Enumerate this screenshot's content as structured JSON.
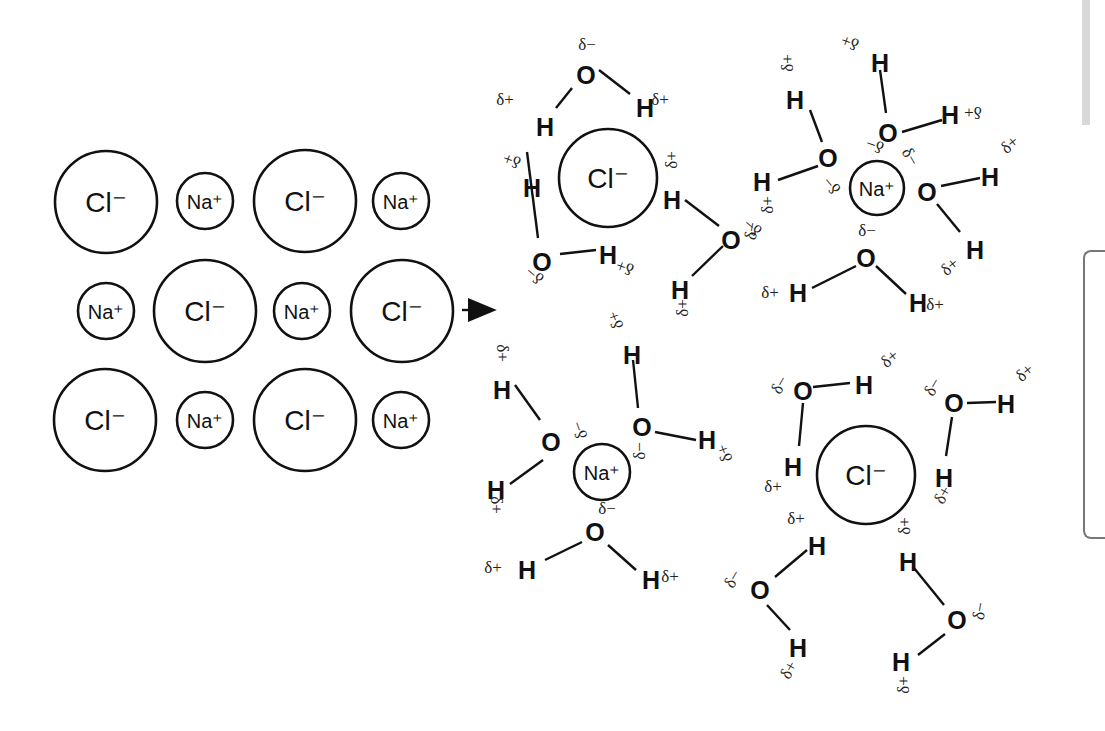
{
  "diagram": {
    "arrow": {
      "x1": 462,
      "y1": 310,
      "x2": 500,
      "y2": 310
    },
    "crystal": {
      "ions": [
        {
          "label": "Cl⁻",
          "x": 106,
          "y": 202,
          "r": 51,
          "type": "Cl"
        },
        {
          "label": "Na⁺",
          "x": 205,
          "y": 201,
          "r": 28,
          "type": "Na"
        },
        {
          "label": "Cl⁻",
          "x": 305,
          "y": 201,
          "r": 51,
          "type": "Cl"
        },
        {
          "label": "Na⁺",
          "x": 401,
          "y": 201,
          "r": 28,
          "type": "Na"
        },
        {
          "label": "Na⁺",
          "x": 106,
          "y": 311,
          "r": 28,
          "type": "Na"
        },
        {
          "label": "Cl⁻",
          "x": 205,
          "y": 311,
          "r": 51,
          "type": "Cl"
        },
        {
          "label": "Na⁺",
          "x": 302,
          "y": 311,
          "r": 28,
          "type": "Na"
        },
        {
          "label": "Cl⁻",
          "x": 402,
          "y": 311,
          "r": 51,
          "type": "Cl"
        },
        {
          "label": "Cl⁻",
          "x": 105,
          "y": 420,
          "r": 51,
          "type": "Cl"
        },
        {
          "label": "Na⁺",
          "x": 205,
          "y": 420,
          "r": 28,
          "type": "Na"
        },
        {
          "label": "Cl⁻",
          "x": 305,
          "y": 420,
          "r": 51,
          "type": "Cl"
        },
        {
          "label": "Na⁺",
          "x": 401,
          "y": 420,
          "r": 28,
          "type": "Na"
        }
      ]
    },
    "hydrated_ions": [
      {
        "label": "Cl⁻",
        "x": 608,
        "y": 178,
        "r": 49,
        "type": "Cl"
      },
      {
        "label": "Na⁺",
        "x": 877,
        "y": 188,
        "r": 27,
        "type": "Na"
      },
      {
        "label": "Na⁺",
        "x": 602,
        "y": 472,
        "r": 28,
        "type": "Na"
      },
      {
        "label": "Cl⁻",
        "x": 866,
        "y": 475,
        "r": 49,
        "type": "Cl"
      }
    ],
    "atoms": [
      {
        "s": "O",
        "x": 586,
        "y": 75
      },
      {
        "s": "H",
        "x": 545,
        "y": 127
      },
      {
        "s": "H",
        "x": 645,
        "y": 108
      },
      {
        "s": "H",
        "x": 532,
        "y": 188
      },
      {
        "s": "O",
        "x": 542,
        "y": 262
      },
      {
        "s": "H",
        "x": 608,
        "y": 255
      },
      {
        "s": "H",
        "x": 672,
        "y": 200
      },
      {
        "s": "O",
        "x": 731,
        "y": 240
      },
      {
        "s": "H",
        "x": 680,
        "y": 290
      },
      {
        "s": "H",
        "x": 880,
        "y": 63
      },
      {
        "s": "O",
        "x": 888,
        "y": 133
      },
      {
        "s": "H",
        "x": 950,
        "y": 115
      },
      {
        "s": "H",
        "x": 795,
        "y": 100
      },
      {
        "s": "O",
        "x": 828,
        "y": 158
      },
      {
        "s": "H",
        "x": 762,
        "y": 182
      },
      {
        "s": "O",
        "x": 927,
        "y": 192
      },
      {
        "s": "H",
        "x": 990,
        "y": 177
      },
      {
        "s": "H",
        "x": 975,
        "y": 250
      },
      {
        "s": "O",
        "x": 866,
        "y": 258
      },
      {
        "s": "H",
        "x": 798,
        "y": 293
      },
      {
        "s": "H",
        "x": 918,
        "y": 303
      },
      {
        "s": "H",
        "x": 502,
        "y": 390
      },
      {
        "s": "O",
        "x": 551,
        "y": 442
      },
      {
        "s": "H",
        "x": 496,
        "y": 490
      },
      {
        "s": "H",
        "x": 632,
        "y": 355
      },
      {
        "s": "O",
        "x": 642,
        "y": 427
      },
      {
        "s": "H",
        "x": 707,
        "y": 440
      },
      {
        "s": "O",
        "x": 595,
        "y": 532
      },
      {
        "s": "H",
        "x": 527,
        "y": 570
      },
      {
        "s": "H",
        "x": 651,
        "y": 580
      },
      {
        "s": "O",
        "x": 803,
        "y": 391
      },
      {
        "s": "H",
        "x": 864,
        "y": 385
      },
      {
        "s": "H",
        "x": 793,
        "y": 467
      },
      {
        "s": "O",
        "x": 954,
        "y": 403
      },
      {
        "s": "H",
        "x": 1006,
        "y": 404
      },
      {
        "s": "H",
        "x": 944,
        "y": 478
      },
      {
        "s": "H",
        "x": 817,
        "y": 546
      },
      {
        "s": "O",
        "x": 760,
        "y": 590
      },
      {
        "s": "H",
        "x": 798,
        "y": 648
      },
      {
        "s": "H",
        "x": 908,
        "y": 562
      },
      {
        "s": "O",
        "x": 957,
        "y": 620
      },
      {
        "s": "H",
        "x": 901,
        "y": 662
      }
    ],
    "bonds": [
      [
        572,
        88,
        556,
        108
      ],
      [
        599,
        70,
        630,
        94
      ],
      [
        527,
        152,
        538,
        238
      ],
      [
        560,
        254,
        596,
        250
      ],
      [
        685,
        200,
        719,
        226
      ],
      [
        723,
        246,
        692,
        276
      ],
      [
        880,
        70,
        886,
        113
      ],
      [
        902,
        132,
        942,
        120
      ],
      [
        810,
        110,
        822,
        142
      ],
      [
        818,
        166,
        778,
        180
      ],
      [
        941,
        186,
        980,
        178
      ],
      [
        937,
        204,
        960,
        232
      ],
      [
        856,
        266,
        812,
        288
      ],
      [
        876,
        266,
        906,
        294
      ],
      [
        515,
        385,
        540,
        420
      ],
      [
        543,
        460,
        510,
        484
      ],
      [
        633,
        360,
        638,
        408
      ],
      [
        655,
        432,
        696,
        440
      ],
      [
        582,
        542,
        545,
        560
      ],
      [
        608,
        545,
        636,
        570
      ],
      [
        813,
        387,
        850,
        383
      ],
      [
        803,
        403,
        799,
        446
      ],
      [
        967,
        403,
        996,
        402
      ],
      [
        952,
        417,
        946,
        456
      ],
      [
        807,
        550,
        775,
        577
      ],
      [
        767,
        605,
        790,
        630
      ],
      [
        914,
        568,
        944,
        605
      ],
      [
        945,
        634,
        918,
        655
      ]
    ],
    "partial_charges": [
      {
        "t": "δ−",
        "x": 587,
        "y": 50,
        "rot": 0
      },
      {
        "t": "δ+",
        "x": 505,
        "y": 105,
        "rot": 0
      },
      {
        "t": "δ+",
        "x": 660,
        "y": 105,
        "rot": 0
      },
      {
        "t": "δ+",
        "x": 512,
        "y": 165,
        "rot": 200
      },
      {
        "t": "δ−",
        "x": 535,
        "y": 280,
        "rot": 220
      },
      {
        "t": "δ+",
        "x": 625,
        "y": 272,
        "rot": 200
      },
      {
        "t": "δ+",
        "x": 672,
        "y": 165,
        "rot": 270
      },
      {
        "t": "δ−",
        "x": 752,
        "y": 236,
        "rot": 280
      },
      {
        "t": "δ+",
        "x": 683,
        "y": 313,
        "rot": 270
      },
      {
        "t": "δ+",
        "x": 850,
        "y": 47,
        "rot": 200
      },
      {
        "t": "δ+",
        "x": 788,
        "y": 68,
        "rot": 270
      },
      {
        "t": "δ+",
        "x": 973,
        "y": 117,
        "rot": 180
      },
      {
        "t": "δ−",
        "x": 875,
        "y": 150,
        "rot": 200
      },
      {
        "t": "δ−",
        "x": 910,
        "y": 162,
        "rot": 60
      },
      {
        "t": "δ−",
        "x": 832,
        "y": 190,
        "rot": 230
      },
      {
        "t": "δ+",
        "x": 768,
        "y": 210,
        "rot": 270
      },
      {
        "t": "δ−",
        "x": 753,
        "y": 232,
        "rot": 220
      },
      {
        "t": "δ+",
        "x": 1010,
        "y": 150,
        "rot": 320
      },
      {
        "t": "δ−",
        "x": 867,
        "y": 236,
        "rot": 0
      },
      {
        "t": "δ+",
        "x": 950,
        "y": 272,
        "rot": 320
      },
      {
        "t": "δ+",
        "x": 770,
        "y": 298,
        "rot": 0
      },
      {
        "t": "δ+",
        "x": 935,
        "y": 310,
        "rot": 0
      },
      {
        "t": "δ+",
        "x": 502,
        "y": 358,
        "rot": 90
      },
      {
        "t": "δ+",
        "x": 616,
        "y": 325,
        "rot": 250
      },
      {
        "t": "δ−",
        "x": 580,
        "y": 435,
        "rot": 250
      },
      {
        "t": "δ−",
        "x": 640,
        "y": 456,
        "rot": 270
      },
      {
        "t": "δ+",
        "x": 496,
        "y": 510,
        "rot": 90
      },
      {
        "t": "δ+",
        "x": 725,
        "y": 458,
        "rot": 250
      },
      {
        "t": "δ−",
        "x": 607,
        "y": 514,
        "rot": 0
      },
      {
        "t": "δ+",
        "x": 493,
        "y": 573,
        "rot": 0
      },
      {
        "t": "δ+",
        "x": 670,
        "y": 582,
        "rot": 0
      },
      {
        "t": "δ−",
        "x": 780,
        "y": 390,
        "rot": 300
      },
      {
        "t": "δ+",
        "x": 890,
        "y": 364,
        "rot": 320
      },
      {
        "t": "δ−",
        "x": 933,
        "y": 392,
        "rot": 300
      },
      {
        "t": "δ+",
        "x": 1025,
        "y": 378,
        "rot": 320
      },
      {
        "t": "δ+",
        "x": 773,
        "y": 492,
        "rot": 0
      },
      {
        "t": "δ+",
        "x": 943,
        "y": 500,
        "rot": 300
      },
      {
        "t": "δ+",
        "x": 796,
        "y": 524,
        "rot": 0
      },
      {
        "t": "δ+",
        "x": 905,
        "y": 531,
        "rot": 270
      },
      {
        "t": "δ−",
        "x": 733,
        "y": 584,
        "rot": 300
      },
      {
        "t": "δ+",
        "x": 789,
        "y": 675,
        "rot": 300
      },
      {
        "t": "δ−",
        "x": 980,
        "y": 616,
        "rot": 280
      },
      {
        "t": "δ+",
        "x": 904,
        "y": 690,
        "rot": 270
      }
    ]
  }
}
